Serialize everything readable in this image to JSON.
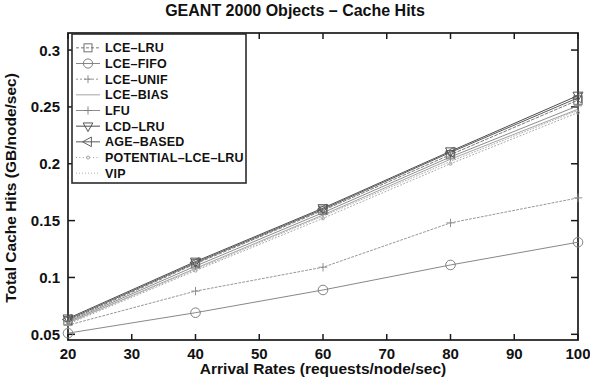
{
  "chart_data": {
    "type": "line",
    "title": "GEANT 2000 Objects – Cache Hits",
    "xlabel": "Arrival Rates (requests/node/sec)",
    "ylabel": "Total Cache Hits (GB/node/sec)",
    "x": [
      20,
      40,
      60,
      80,
      100
    ],
    "xlim": [
      20,
      100
    ],
    "ylim": [
      0.045,
      0.315
    ],
    "xticks": [
      20,
      30,
      40,
      50,
      60,
      70,
      80,
      90,
      100
    ],
    "xticklabels": [
      "20",
      "30",
      "40",
      "50",
      "60",
      "70",
      "80",
      "90",
      "100"
    ],
    "yticks": [
      0.05,
      0.1,
      0.15,
      0.2,
      0.25,
      0.3
    ],
    "yticklabels": [
      "0.05",
      "0.1",
      "0.15",
      "0.2",
      "0.25",
      "0.3"
    ],
    "grid": false,
    "legend_position": "upper-left",
    "series": [
      {
        "name": "LCE–LRU",
        "marker": "square",
        "dash": "3 2",
        "width": 0.9,
        "color": "#6a6a6a",
        "values": [
          0.062,
          0.112,
          0.159,
          0.208,
          0.256
        ]
      },
      {
        "name": "LCE–FIFO",
        "marker": "circle",
        "dash": "0",
        "width": 0.9,
        "color": "#7a7a7a",
        "values": [
          0.051,
          0.069,
          0.089,
          0.111,
          0.131
        ]
      },
      {
        "name": "LCE–UNIF",
        "marker": "plus",
        "dash": "2 2",
        "width": 0.9,
        "color": "#8a8a8a",
        "values": [
          0.058,
          0.088,
          0.109,
          0.148,
          0.17
        ]
      },
      {
        "name": "LCE–BIAS",
        "marker": "none",
        "dash": "0",
        "width": 0.9,
        "color": "#9a9a9a",
        "values": [
          0.06,
          0.108,
          0.155,
          0.204,
          0.248
        ]
      },
      {
        "name": "LFU",
        "marker": "plus",
        "dash": "0",
        "width": 0.9,
        "color": "#808080",
        "values": [
          0.061,
          0.11,
          0.157,
          0.206,
          0.251
        ]
      },
      {
        "name": "LCD–LRU",
        "marker": "triangle",
        "dash": "0",
        "width": 1.0,
        "color": "#4d4d4d",
        "values": [
          0.064,
          0.114,
          0.161,
          0.211,
          0.26
        ]
      },
      {
        "name": "AGE–BASED",
        "marker": "ltri",
        "dash": "0",
        "width": 1.0,
        "color": "#5a5a5a",
        "values": [
          0.063,
          0.113,
          0.16,
          0.21,
          0.258
        ]
      },
      {
        "name": "POTENTIAL–LCE–LRU",
        "marker": "dot",
        "dash": "1 2.4",
        "width": 0.9,
        "color": "#9c9c9c",
        "values": [
          0.059,
          0.106,
          0.152,
          0.2,
          0.245
        ]
      },
      {
        "name": "VIP",
        "marker": "none",
        "dash": "1 2",
        "width": 0.9,
        "color": "#a5a5a5",
        "values": [
          0.06,
          0.107,
          0.154,
          0.202,
          0.247
        ]
      }
    ]
  },
  "plot": {
    "left": 68,
    "right": 578,
    "top": 33,
    "bottom": 340
  },
  "legend": {
    "x": 72,
    "y": 34,
    "w": 174,
    "h": 149
  }
}
